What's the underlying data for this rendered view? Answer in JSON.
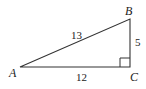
{
  "diagram": {
    "type": "right-triangle",
    "vertices": {
      "A": "A",
      "B": "B",
      "C": "C"
    },
    "sides": {
      "AB": "13",
      "AC": "12",
      "BC": "5"
    },
    "right_angle_at": "C",
    "stroke_color": "#333333"
  }
}
